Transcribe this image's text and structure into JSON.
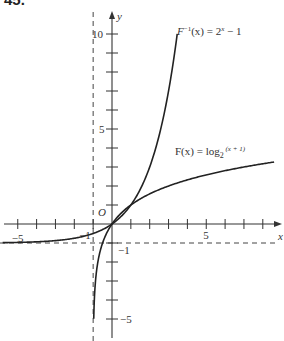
{
  "problem_number": "45.",
  "chart_data": {
    "type": "line",
    "title": "",
    "xlabel": "x",
    "ylabel": "y",
    "xlim": [
      -5.8,
      9
    ],
    "ylim": [
      -6,
      11
    ],
    "grid": false,
    "origin_label": "O",
    "x_ticks": [
      -5,
      -4,
      -3,
      -2,
      -1,
      1,
      2,
      3,
      4,
      5,
      6,
      7,
      8
    ],
    "x_tick_labels": [
      {
        "value": -5,
        "label": "−5"
      },
      {
        "value": -1,
        "label": "−1"
      },
      {
        "value": 5,
        "label": "5"
      }
    ],
    "y_ticks": [
      -5,
      -4,
      -3,
      -2,
      -1,
      1,
      2,
      3,
      4,
      5,
      6,
      7,
      8,
      9,
      10
    ],
    "y_tick_labels": [
      {
        "value": 10,
        "label": "10"
      },
      {
        "value": 5,
        "label": "5"
      },
      {
        "value": -1,
        "label": "−1"
      },
      {
        "value": -5,
        "label": "−5"
      }
    ],
    "asymptotes": [
      {
        "type": "vertical",
        "x": -1,
        "style": "dashed"
      },
      {
        "type": "horizontal",
        "y": -1,
        "style": "dashed"
      }
    ],
    "series": [
      {
        "name": "F^{-1}(x) = 2^x − 1",
        "function": "2^x - 1",
        "x_range": [
          -5.8,
          3.5
        ],
        "points": [
          [
            -5.8,
            -0.98
          ],
          [
            -5,
            -0.97
          ],
          [
            -3,
            -0.875
          ],
          [
            -2,
            -0.75
          ],
          [
            -1,
            -0.5
          ],
          [
            0,
            0
          ],
          [
            1,
            1
          ],
          [
            2,
            3
          ],
          [
            3,
            7
          ],
          [
            3.46,
            10
          ]
        ]
      },
      {
        "name": "F(x) = log_2(x + 1)",
        "function": "log2(x + 1)",
        "x_range": [
          -0.97,
          9
        ],
        "points": [
          [
            -0.97,
            -5.06
          ],
          [
            -0.9,
            -3.32
          ],
          [
            -0.75,
            -2
          ],
          [
            -0.5,
            -1
          ],
          [
            0,
            0
          ],
          [
            1,
            1
          ],
          [
            3,
            2
          ],
          [
            7,
            3
          ],
          [
            8.6,
            3.26
          ]
        ]
      }
    ],
    "annotations": [
      {
        "text_main": "F",
        "text_sup": "−1",
        "text_rest": "(x) = 2",
        "text_exp": "x",
        "text_tail": " − 1",
        "near": [
          3.6,
          10
        ]
      },
      {
        "text_main": "F(x) = log",
        "text_sub": "2",
        "text_rest": " (x + 1)",
        "near": [
          4.7,
          4.1
        ]
      }
    ]
  }
}
